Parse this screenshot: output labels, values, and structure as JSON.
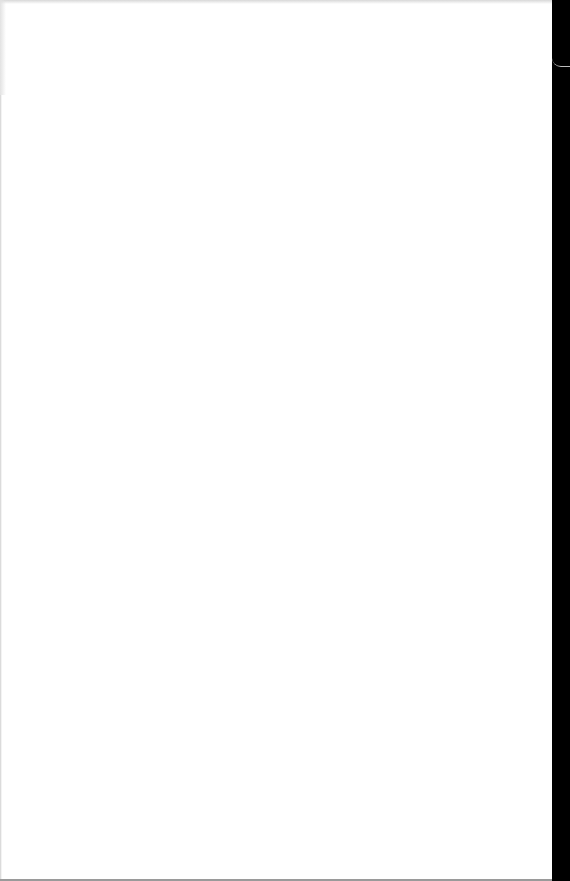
{
  "document": {
    "type": "blank-scanned-page",
    "text": ""
  },
  "colors": {
    "paper": "#ffffff",
    "right_strip": "#000000",
    "edge_shadow": "#d8d8d8",
    "bottom_line": "#9a9a9a"
  }
}
